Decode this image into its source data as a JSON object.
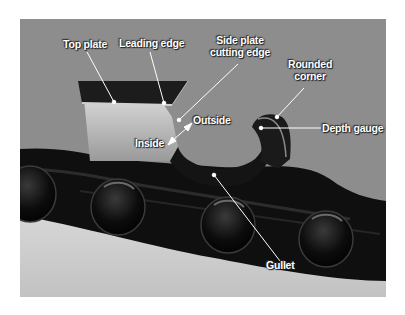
{
  "figure": {
    "labels": {
      "top_plate": "Top plate",
      "leading_edge": "Leading edge",
      "side_plate_line1": "Side plate",
      "side_plate_line2": "cutting edge",
      "rounded_corner_line1": "Rounded",
      "rounded_corner_line2": "corner",
      "depth_gauge": "Depth gauge",
      "outside": "Outside",
      "inside": "Inside",
      "gullet": "Gullet"
    },
    "colors": {
      "background": "#8d8d8d",
      "floor": "#c9c9c9",
      "chain": "#111111",
      "cutter_side": "#c4c4c4",
      "label_text": "#ffffff"
    }
  }
}
